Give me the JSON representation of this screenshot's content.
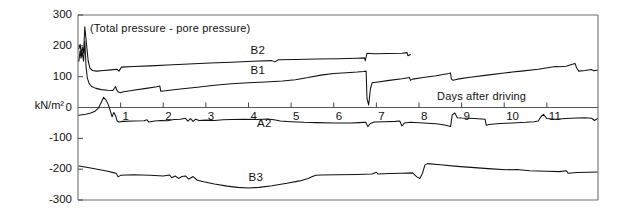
{
  "figure": {
    "caption": "(Total pressure - pore pressure)",
    "y_axis_unit": "kN/m²",
    "x_axis_label": "Days after driving"
  },
  "chart_data": {
    "type": "line",
    "title": "(Total pressure - pore pressure)",
    "xlabel": "Days after driving",
    "ylabel": "kN/m²",
    "xlim": [
      0,
      12.2
    ],
    "ylim": [
      -300,
      300
    ],
    "grid": false,
    "legend": "inline-curve-labels",
    "yticks": [
      300,
      200,
      100,
      0,
      -100,
      -200,
      -300
    ],
    "ytick_labels": [
      "300",
      "200",
      "100",
      "0",
      "-100",
      "-200",
      "-300"
    ],
    "xticks": [
      1,
      2,
      3,
      4,
      5,
      6,
      7,
      8,
      9,
      10,
      11
    ],
    "xtick_labels": [
      "1",
      "2",
      "3",
      "4",
      "5",
      "6",
      "7",
      "8",
      "9",
      "10",
      "11"
    ],
    "line_color": "#111111",
    "series": [
      {
        "name": "B2",
        "label_x": 4.05,
        "label_y": 182,
        "points": [
          [
            0.02,
            190
          ],
          [
            0.05,
            205
          ],
          [
            0.08,
            168
          ],
          [
            0.1,
            196
          ],
          [
            0.13,
            176
          ],
          [
            0.16,
            262
          ],
          [
            0.2,
            205
          ],
          [
            0.24,
            150
          ],
          [
            0.28,
            128
          ],
          [
            0.34,
            120
          ],
          [
            0.44,
            118
          ],
          [
            0.6,
            120
          ],
          [
            0.78,
            122
          ],
          [
            0.92,
            124
          ],
          [
            0.96,
            118
          ],
          [
            1.02,
            131
          ],
          [
            1.3,
            133
          ],
          [
            1.7,
            135
          ],
          [
            2.1,
            138
          ],
          [
            2.6,
            141
          ],
          [
            3.1,
            144
          ],
          [
            3.6,
            147
          ],
          [
            4.1,
            150
          ],
          [
            4.55,
            152
          ],
          [
            4.62,
            148
          ],
          [
            4.7,
            155
          ],
          [
            5.1,
            156
          ],
          [
            5.6,
            157
          ],
          [
            6.1,
            158
          ],
          [
            6.55,
            160
          ],
          [
            6.72,
            161
          ],
          [
            6.74,
            152
          ],
          [
            6.78,
            176
          ],
          [
            6.95,
            174
          ],
          [
            7.3,
            175
          ],
          [
            7.6,
            176
          ],
          [
            7.72,
            178
          ],
          [
            7.74,
            168
          ],
          [
            7.8,
            172
          ]
        ]
      },
      {
        "name": "B1",
        "label_x": 4.05,
        "label_y": 118,
        "points": [
          [
            0.02,
            150
          ],
          [
            0.05,
            185
          ],
          [
            0.07,
            160
          ],
          [
            0.1,
            178
          ],
          [
            0.13,
            150
          ],
          [
            0.16,
            215
          ],
          [
            0.19,
            130
          ],
          [
            0.22,
            95
          ],
          [
            0.26,
            78
          ],
          [
            0.32,
            68
          ],
          [
            0.42,
            62
          ],
          [
            0.55,
            58
          ],
          [
            0.7,
            56
          ],
          [
            0.82,
            55
          ],
          [
            0.88,
            68
          ],
          [
            0.91,
            56
          ],
          [
            0.95,
            50
          ],
          [
            1.0,
            48
          ],
          [
            1.04,
            50
          ],
          [
            1.3,
            56
          ],
          [
            1.6,
            62
          ],
          [
            1.85,
            67
          ],
          [
            1.92,
            70
          ],
          [
            1.94,
            53
          ],
          [
            2.05,
            54
          ],
          [
            2.4,
            60
          ],
          [
            2.8,
            66
          ],
          [
            3.2,
            72
          ],
          [
            3.6,
            77
          ],
          [
            4.0,
            80
          ],
          [
            4.4,
            83
          ],
          [
            4.8,
            86
          ],
          [
            5.1,
            90
          ],
          [
            5.4,
            97
          ],
          [
            5.7,
            105
          ],
          [
            6.0,
            110
          ],
          [
            6.3,
            113
          ],
          [
            6.55,
            115
          ],
          [
            6.7,
            117
          ],
          [
            6.76,
            118
          ],
          [
            6.78,
            30
          ],
          [
            6.82,
            8
          ],
          [
            6.86,
            60
          ],
          [
            6.9,
            80
          ],
          [
            7.0,
            82
          ],
          [
            7.3,
            88
          ],
          [
            7.6,
            93
          ],
          [
            7.78,
            97
          ],
          [
            7.8,
            88
          ],
          [
            7.85,
            92
          ],
          [
            8.1,
            97
          ],
          [
            8.4,
            103
          ],
          [
            8.6,
            108
          ],
          [
            8.7,
            110
          ],
          [
            8.74,
            112
          ],
          [
            8.76,
            92
          ],
          [
            8.8,
            88
          ],
          [
            8.9,
            92
          ],
          [
            9.2,
            98
          ],
          [
            9.6,
            105
          ],
          [
            10.0,
            112
          ],
          [
            10.4,
            118
          ],
          [
            10.8,
            124
          ],
          [
            11.05,
            130
          ],
          [
            11.2,
            133
          ],
          [
            11.3,
            132
          ],
          [
            11.45,
            134
          ],
          [
            11.6,
            140
          ],
          [
            11.66,
            143
          ],
          [
            11.7,
            128
          ],
          [
            11.75,
            118
          ],
          [
            11.9,
            120
          ],
          [
            12.05,
            123
          ],
          [
            12.1,
            119
          ],
          [
            12.18,
            121
          ]
        ]
      },
      {
        "name": "A2",
        "label_x": 4.2,
        "label_y": -52,
        "points": [
          [
            0.02,
            -25
          ],
          [
            0.18,
            -22
          ],
          [
            0.3,
            -18
          ],
          [
            0.4,
            -12
          ],
          [
            0.48,
            -2
          ],
          [
            0.55,
            18
          ],
          [
            0.6,
            33
          ],
          [
            0.66,
            24
          ],
          [
            0.72,
            6
          ],
          [
            0.76,
            -12
          ],
          [
            0.8,
            -30
          ],
          [
            0.84,
            -16
          ],
          [
            0.88,
            -26
          ],
          [
            0.92,
            -44
          ],
          [
            0.96,
            -47
          ],
          [
            1.05,
            -45
          ],
          [
            1.3,
            -44
          ],
          [
            1.55,
            -43
          ],
          [
            1.62,
            -40
          ],
          [
            1.66,
            -47
          ],
          [
            1.8,
            -44
          ],
          [
            1.95,
            -42
          ],
          [
            2.1,
            -43
          ],
          [
            2.25,
            -39
          ],
          [
            2.4,
            -38
          ],
          [
            2.52,
            -35
          ],
          [
            2.58,
            -44
          ],
          [
            2.64,
            -36
          ],
          [
            2.7,
            -45
          ],
          [
            2.76,
            -38
          ],
          [
            2.84,
            -42
          ],
          [
            3.0,
            -41
          ],
          [
            3.2,
            -42
          ],
          [
            3.4,
            -40
          ],
          [
            3.6,
            -39
          ],
          [
            3.9,
            -38
          ],
          [
            4.2,
            -39
          ],
          [
            4.45,
            -37
          ],
          [
            4.6,
            -40
          ],
          [
            4.75,
            -44
          ],
          [
            5.0,
            -46
          ],
          [
            5.3,
            -48
          ],
          [
            5.6,
            -49
          ],
          [
            6.0,
            -50
          ],
          [
            6.4,
            -50
          ],
          [
            6.6,
            -49
          ],
          [
            6.75,
            -48
          ],
          [
            6.8,
            -62
          ],
          [
            6.86,
            -52
          ],
          [
            6.95,
            -47
          ],
          [
            7.2,
            -46
          ],
          [
            7.45,
            -45
          ],
          [
            7.55,
            -44
          ],
          [
            7.6,
            -60
          ],
          [
            7.66,
            -50
          ],
          [
            7.8,
            -48
          ],
          [
            8.1,
            -50
          ],
          [
            8.4,
            -53
          ],
          [
            8.6,
            -57
          ],
          [
            8.7,
            -60
          ],
          [
            8.74,
            -62
          ],
          [
            8.78,
            -24
          ],
          [
            8.84,
            -18
          ],
          [
            8.9,
            -33
          ],
          [
            9.0,
            -34
          ],
          [
            9.3,
            -36
          ],
          [
            9.55,
            -38
          ],
          [
            9.58,
            -58
          ],
          [
            9.64,
            -55
          ],
          [
            9.9,
            -52
          ],
          [
            10.2,
            -50
          ],
          [
            10.5,
            -48
          ],
          [
            10.7,
            -46
          ],
          [
            10.8,
            -44
          ],
          [
            10.86,
            -30
          ],
          [
            10.92,
            -22
          ],
          [
            11.0,
            -36
          ],
          [
            11.2,
            -38
          ],
          [
            11.45,
            -36
          ],
          [
            11.7,
            -34
          ],
          [
            11.9,
            -33
          ],
          [
            12.05,
            -35
          ],
          [
            12.12,
            -42
          ],
          [
            12.18,
            -36
          ]
        ]
      },
      {
        "name": "B3",
        "label_x": 4.0,
        "label_y": -228,
        "points": [
          [
            0.02,
            -190
          ],
          [
            0.2,
            -194
          ],
          [
            0.45,
            -200
          ],
          [
            0.7,
            -207
          ],
          [
            0.85,
            -212
          ],
          [
            0.9,
            -214
          ],
          [
            0.94,
            -225
          ],
          [
            1.0,
            -220
          ],
          [
            1.3,
            -218
          ],
          [
            1.7,
            -220
          ],
          [
            2.0,
            -222
          ],
          [
            2.15,
            -219
          ],
          [
            2.2,
            -228
          ],
          [
            2.28,
            -222
          ],
          [
            2.36,
            -230
          ],
          [
            2.44,
            -224
          ],
          [
            2.52,
            -222
          ],
          [
            2.6,
            -232
          ],
          [
            2.7,
            -224
          ],
          [
            2.8,
            -236
          ],
          [
            2.95,
            -241
          ],
          [
            3.2,
            -248
          ],
          [
            3.5,
            -255
          ],
          [
            3.75,
            -259
          ],
          [
            4.0,
            -261
          ],
          [
            4.25,
            -259
          ],
          [
            4.55,
            -254
          ],
          [
            4.9,
            -246
          ],
          [
            5.2,
            -238
          ],
          [
            5.4,
            -230
          ],
          [
            5.5,
            -224
          ],
          [
            5.58,
            -220
          ],
          [
            5.7,
            -219
          ],
          [
            6.1,
            -218
          ],
          [
            6.55,
            -217
          ],
          [
            6.9,
            -216
          ],
          [
            7.0,
            -210
          ],
          [
            7.04,
            -216
          ],
          [
            7.3,
            -214
          ],
          [
            7.6,
            -213
          ],
          [
            7.85,
            -212
          ],
          [
            7.95,
            -225
          ],
          [
            8.02,
            -230
          ],
          [
            8.08,
            -214
          ],
          [
            8.14,
            -186
          ],
          [
            8.2,
            -182
          ],
          [
            8.5,
            -186
          ],
          [
            8.9,
            -191
          ],
          [
            9.3,
            -195
          ],
          [
            9.7,
            -199
          ],
          [
            10.05,
            -202
          ],
          [
            10.3,
            -201
          ],
          [
            10.6,
            -205
          ],
          [
            11.0,
            -207
          ],
          [
            11.3,
            -208
          ],
          [
            11.45,
            -205
          ],
          [
            11.5,
            -213
          ],
          [
            11.7,
            -211
          ],
          [
            12.0,
            -210
          ],
          [
            12.18,
            -209
          ]
        ]
      }
    ]
  }
}
